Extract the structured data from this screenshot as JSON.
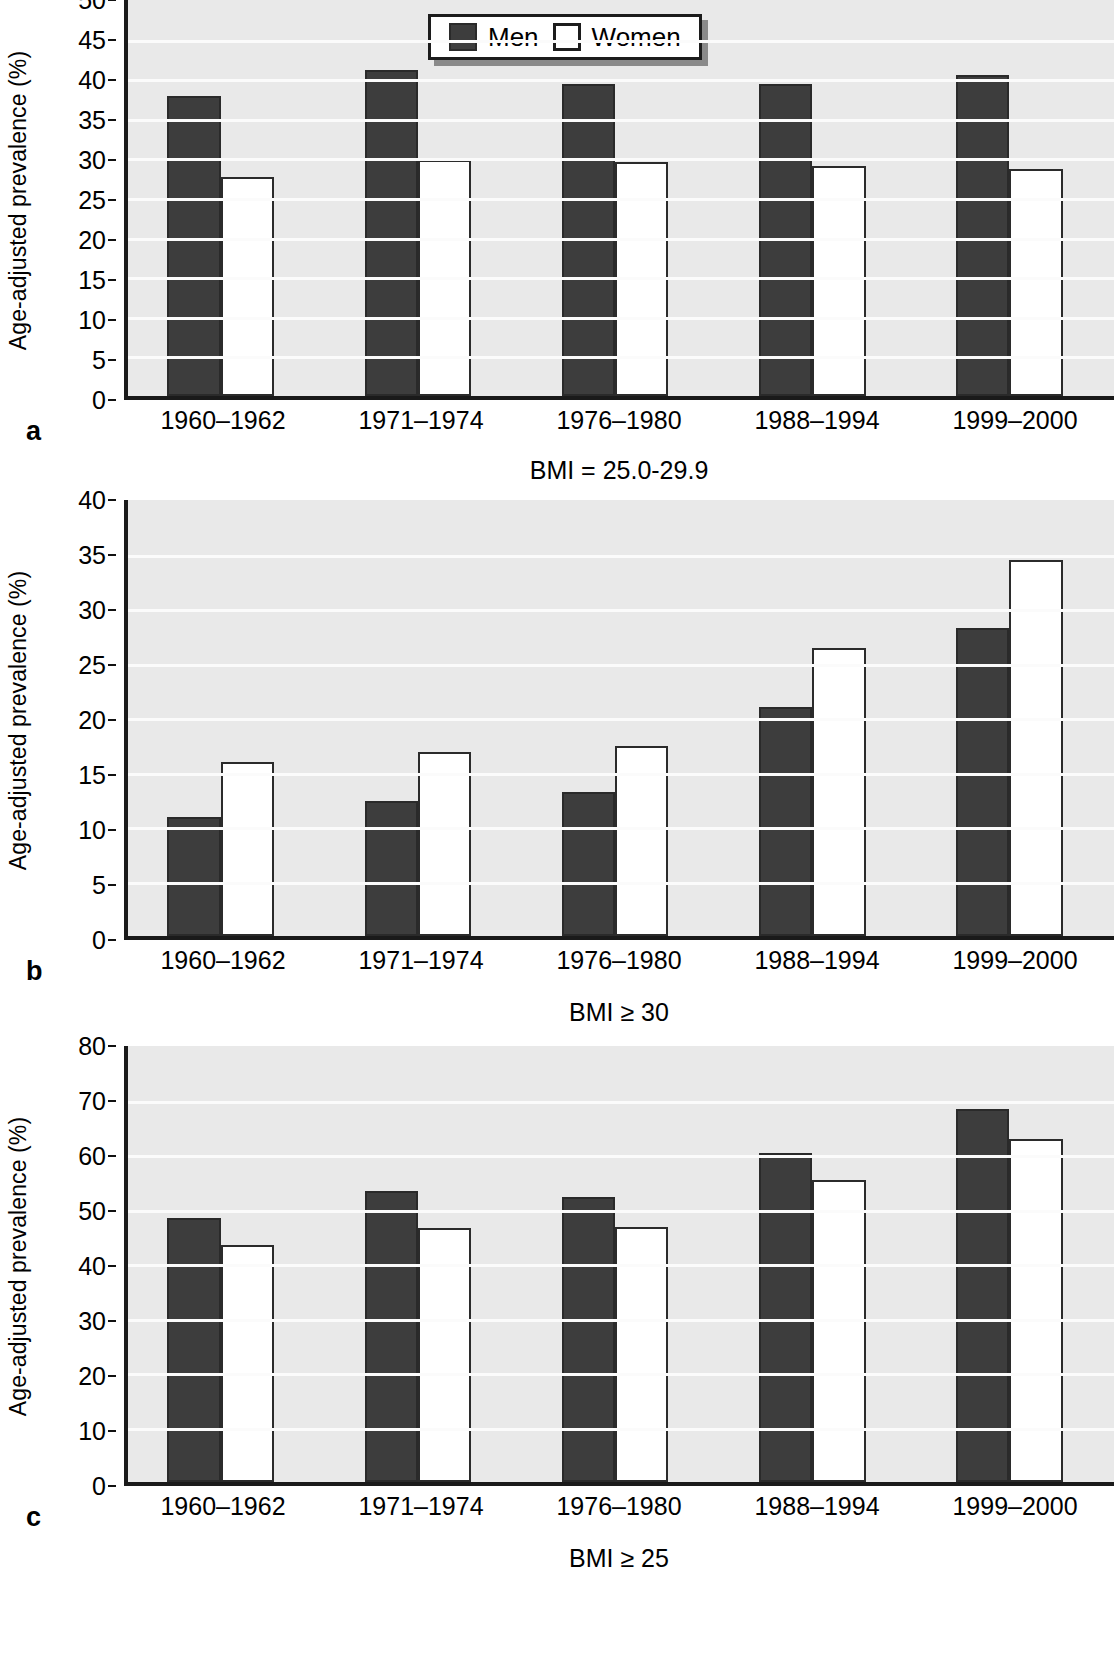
{
  "figure": {
    "y_axis_title": "Age-adjusted prevalence (%)",
    "legend": {
      "men_label": "Men",
      "women_label": "Women",
      "men_color": "#3d3d3d",
      "women_color": "#ffffff"
    }
  },
  "panels": [
    {
      "letter": "a",
      "caption": "BMI = 25.0-29.9",
      "ylabel": "Age-adjusted prevalence (%)"
    },
    {
      "letter": "b",
      "caption": "BMI ≥ 30",
      "ylabel": "Age-adjusted prevalence (%)"
    },
    {
      "letter": "c",
      "caption": "BMI ≥ 25",
      "ylabel": "Age-adjusted prevalence (%)"
    }
  ],
  "chart_data": [
    {
      "type": "bar",
      "title": "BMI = 25.0-29.9",
      "panel": "a",
      "categories": [
        "1960–1962",
        "1971–1974",
        "1976–1980",
        "1988–1994",
        "1999–2000"
      ],
      "series": [
        {
          "name": "Men",
          "values": [
            37.9,
            41.2,
            39.4,
            39.4,
            40.5
          ]
        },
        {
          "name": "Women",
          "values": [
            27.7,
            29.8,
            29.5,
            29.1,
            28.7
          ]
        }
      ],
      "xlabel": "",
      "ylabel": "Age-adjusted prevalence (%)",
      "ylim": [
        0,
        50
      ],
      "yticks": [
        0,
        5,
        10,
        15,
        20,
        25,
        30,
        35,
        40,
        45,
        50
      ],
      "grid": true,
      "legend_position": "top-center"
    },
    {
      "type": "bar",
      "title": "BMI ≥ 30",
      "panel": "b",
      "categories": [
        "1960–1962",
        "1971–1974",
        "1976–1980",
        "1988–1994",
        "1999–2000"
      ],
      "series": [
        {
          "name": "Men",
          "values": [
            10.9,
            12.4,
            13.2,
            21.0,
            28.3
          ]
        },
        {
          "name": "Women",
          "values": [
            16.0,
            16.9,
            17.4,
            26.4,
            34.5
          ]
        }
      ],
      "xlabel": "",
      "ylabel": "Age-adjusted prevalence (%)",
      "ylim": [
        0,
        40
      ],
      "yticks": [
        0,
        5,
        10,
        15,
        20,
        25,
        30,
        35,
        40
      ],
      "grid": true,
      "legend_position": "none"
    },
    {
      "type": "bar",
      "title": "BMI ≥ 25",
      "panel": "c",
      "categories": [
        "1960–1962",
        "1971–1974",
        "1976–1980",
        "1988–1994",
        "1999–2000"
      ],
      "series": [
        {
          "name": "Men",
          "values": [
            48.5,
            53.4,
            52.3,
            60.4,
            68.4
          ]
        },
        {
          "name": "Women",
          "values": [
            43.5,
            46.6,
            46.8,
            55.4,
            63.0
          ]
        }
      ],
      "xlabel": "",
      "ylabel": "Age-adjusted prevalence (%)",
      "ylim": [
        0,
        80
      ],
      "yticks": [
        0,
        10,
        20,
        30,
        40,
        50,
        60,
        70,
        80
      ],
      "grid": true,
      "legend_position": "none"
    }
  ]
}
